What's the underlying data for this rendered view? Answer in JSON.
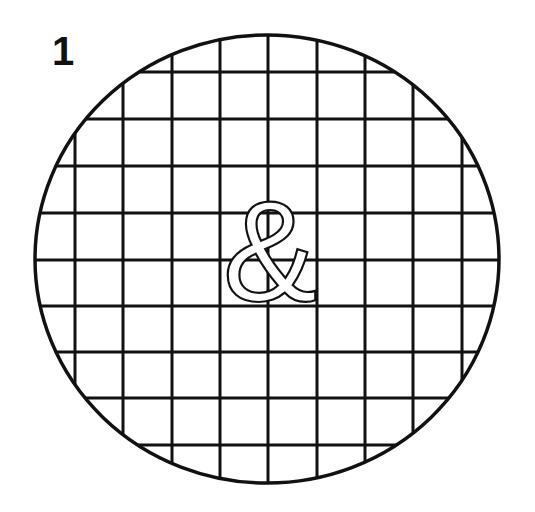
{
  "figure": {
    "number_label": "1",
    "center_symbol": "&",
    "colors": {
      "stroke": "#111111",
      "background": "#ffffff"
    },
    "circle": {
      "cx": 267,
      "cy": 259,
      "rx": 232,
      "ry": 224
    },
    "grid": {
      "vertical_lines_x": [
        75,
        123,
        172,
        220,
        268,
        317,
        365,
        413,
        462
      ],
      "horizontal_lines_y": [
        72,
        119,
        166,
        213,
        260,
        306,
        352,
        398,
        445
      ]
    }
  }
}
